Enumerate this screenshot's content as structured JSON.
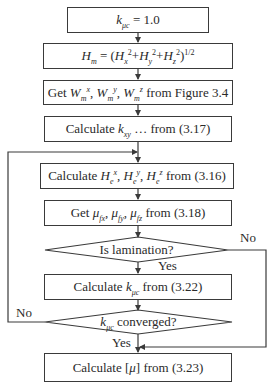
{
  "diagram": {
    "type": "flowchart",
    "stroke_color": "#3a3a3a",
    "text_color": "#2a2a2a",
    "nodes": [
      {
        "id": "init",
        "shape": "process",
        "var": "k",
        "var_sub": "μc",
        "rest": " = 1.0"
      },
      {
        "id": "hm",
        "shape": "process",
        "lhs": "H",
        "lhs_sub": "m",
        "eq": " = (",
        "t1": "H",
        "t1_sub": "x",
        "t1_sup": "2",
        "plus1": "+",
        "t2": "H",
        "t2_sub": "y",
        "t2_sup": "2",
        "plus2": "+",
        "t3": "H",
        "t3_sub": "z",
        "t3_sup": "2",
        "close": ")",
        "exp": "1/2"
      },
      {
        "id": "getw",
        "shape": "process",
        "pre": "Get ",
        "w": "W",
        "w_sub": "m",
        "sx": "x",
        "sy": "y",
        "sz": "z",
        "sep": ", ",
        "post": " from Figure 3.4"
      },
      {
        "id": "kxy",
        "shape": "process",
        "pre": "Calculate ",
        "var": "k",
        "var_sub": "xy",
        "post": " … from (3.17)"
      },
      {
        "id": "he",
        "shape": "process",
        "pre": "Calculate ",
        "h": "H",
        "h_sub": "e",
        "sx": "x",
        "sy": "y",
        "sz": "z",
        "sep": ", ",
        "post": " from (3.16)"
      },
      {
        "id": "mu",
        "shape": "process",
        "pre": "Get ",
        "m": "μ",
        "s1": "fx",
        "s2": "fy",
        "s3": "fz",
        "sep": ", ",
        "post": " from (3.18)"
      },
      {
        "id": "lam",
        "shape": "decision",
        "text": "Is lamination?"
      },
      {
        "id": "kcalc",
        "shape": "process",
        "pre": "Calculate ",
        "var": "k",
        "var_sub": "μc",
        "post": " from (3.22)"
      },
      {
        "id": "conv",
        "shape": "decision",
        "var": "k",
        "var_sub": "μc",
        "post": " converged?"
      },
      {
        "id": "final",
        "shape": "process",
        "pre": "Calculate [",
        "m": "μ",
        "post": "] from (3.23)"
      }
    ],
    "edge_labels": {
      "lam_no": "No",
      "lam_yes": "Yes",
      "conv_no": "No",
      "conv_yes": "Yes"
    }
  }
}
